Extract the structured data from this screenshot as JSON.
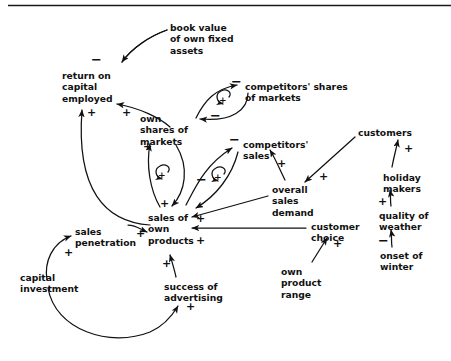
{
  "diagram": {
    "type": "causal-loop-diagram",
    "top_rule": true,
    "nodes": [
      {
        "id": "book-value",
        "label": "book value\nof own fixed\nassets",
        "x": 170,
        "y": 22
      },
      {
        "id": "return-on-capital",
        "label": "return on\ncapital\nemployed",
        "x": 62,
        "y": 70
      },
      {
        "id": "competitors-shares",
        "label": "competitors' shares\nof markets",
        "x": 245,
        "y": 81
      },
      {
        "id": "own-shares",
        "label": "own\nshares of\nmarkets",
        "x": 140,
        "y": 113
      },
      {
        "id": "competitors-sales",
        "label": "competitors'\nsales",
        "x": 243,
        "y": 139
      },
      {
        "id": "customers",
        "label": "customers",
        "x": 358,
        "y": 127
      },
      {
        "id": "overall-sales-demand",
        "label": "overall\nsales\ndemand",
        "x": 272,
        "y": 184
      },
      {
        "id": "holiday-makers",
        "label": "holiday\nmakers",
        "x": 383,
        "y": 172
      },
      {
        "id": "quality-of-weather",
        "label": "quality of\nweather",
        "x": 379,
        "y": 210
      },
      {
        "id": "onset-of-winter",
        "label": "onset of\nwinter",
        "x": 380,
        "y": 250
      },
      {
        "id": "sales-of-own-products",
        "label": "sales of\nown\nproducts",
        "x": 148,
        "y": 212
      },
      {
        "id": "sales-penetration",
        "label": "sales\npenetration",
        "x": 75,
        "y": 226
      },
      {
        "id": "customer-choice",
        "label": "customer\nchoice",
        "x": 311,
        "y": 221
      },
      {
        "id": "capital-investment",
        "label": "capital\ninvestment",
        "x": 20,
        "y": 272
      },
      {
        "id": "own-product-range",
        "label": "own\nproduct\nrange",
        "x": 281,
        "y": 266
      },
      {
        "id": "success-of-advertising",
        "label": "success of\nadvertising",
        "x": 164,
        "y": 281
      }
    ],
    "polarities": [
      {
        "id": "p-book-value-to-roce",
        "sign": "−",
        "x": 91,
        "y": 56
      },
      {
        "id": "p-own-shares-to-roce",
        "sign": "+",
        "x": 122,
        "y": 107
      },
      {
        "id": "p-sales-to-roce",
        "sign": "+",
        "x": 87,
        "y": 107
      },
      {
        "id": "p-own-shares-to-competitors-shares",
        "sign": "−",
        "x": 231,
        "y": 78
      },
      {
        "id": "p-competitors-shares-to-own-shares",
        "sign": "−",
        "x": 210,
        "y": 112
      },
      {
        "id": "p-sales-to-own-shares",
        "sign": "+",
        "x": 143,
        "y": 141
      },
      {
        "id": "p-sales-to-competitors-sales",
        "sign": "−",
        "x": 229,
        "y": 136
      },
      {
        "id": "p-competitors-sales-to-sales",
        "sign": "−",
        "x": 196,
        "y": 176
      },
      {
        "id": "p-own-shares-to-sales",
        "sign": "+",
        "x": 160,
        "y": 198
      },
      {
        "id": "p-overall-demand-to-competitors-sales",
        "sign": "+",
        "x": 277,
        "y": 158
      },
      {
        "id": "p-customers-to-overall-demand",
        "sign": "+",
        "x": 319,
        "y": 171
      },
      {
        "id": "p-holiday-makers-to-customers",
        "sign": "+",
        "x": 404,
        "y": 143
      },
      {
        "id": "p-weather-to-holiday-makers",
        "sign": "+",
        "x": 380,
        "y": 196
      },
      {
        "id": "p-winter-to-weather",
        "sign": "−",
        "x": 380,
        "y": 237
      },
      {
        "id": "p-overall-demand-to-sales",
        "sign": "+",
        "x": 196,
        "y": 213
      },
      {
        "id": "p-customer-choice-to-sales",
        "sign": "+",
        "x": 196,
        "y": 235
      },
      {
        "id": "p-product-range-to-customer-choice",
        "sign": "+",
        "x": 319,
        "y": 244
      },
      {
        "id": "p-penetration-to-sales",
        "sign": "+",
        "x": 136,
        "y": 228
      },
      {
        "id": "p-capital-to-penetration",
        "sign": "+",
        "x": 64,
        "y": 247
      },
      {
        "id": "p-advertising-to-sales",
        "sign": "+",
        "x": 162,
        "y": 258
      },
      {
        "id": "p-capital-to-advertising",
        "sign": "+",
        "x": 182,
        "y": 311
      }
    ],
    "loops": [
      {
        "id": "loop-own-vs-competitors-shares",
        "sign": "+",
        "cx": 221,
        "cy": 101
      },
      {
        "id": "loop-own-shares-sales",
        "cx": 161,
        "cy": 175,
        "sign": "+"
      },
      {
        "id": "loop-competitors-sales-sales",
        "sign": "+",
        "cx": 217,
        "cy": 178
      }
    ]
  }
}
